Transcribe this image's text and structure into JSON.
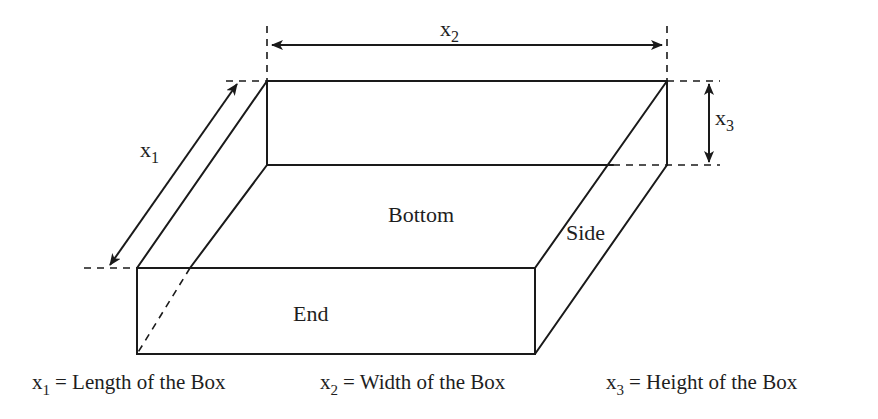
{
  "diagram": {
    "type": "isometric-box-with-dimensions",
    "faces": {
      "bottom": "Bottom",
      "side": "Side",
      "end": "End"
    },
    "dimensions": {
      "x1": {
        "symbol": "x",
        "sub": "1"
      },
      "x2": {
        "symbol": "x",
        "sub": "2"
      },
      "x3": {
        "symbol": "x",
        "sub": "3"
      }
    },
    "legend": [
      {
        "symbol": "x",
        "sub": "1",
        "text": "= Length of the Box"
      },
      {
        "symbol": "x",
        "sub": "2",
        "text": "= Width of the Box"
      },
      {
        "symbol": "x",
        "sub": "3",
        "text": "= Height of the Box"
      }
    ],
    "colors": {
      "line": "#1a1a1a",
      "text": "#1e1e1e",
      "background": "#ffffff"
    }
  }
}
